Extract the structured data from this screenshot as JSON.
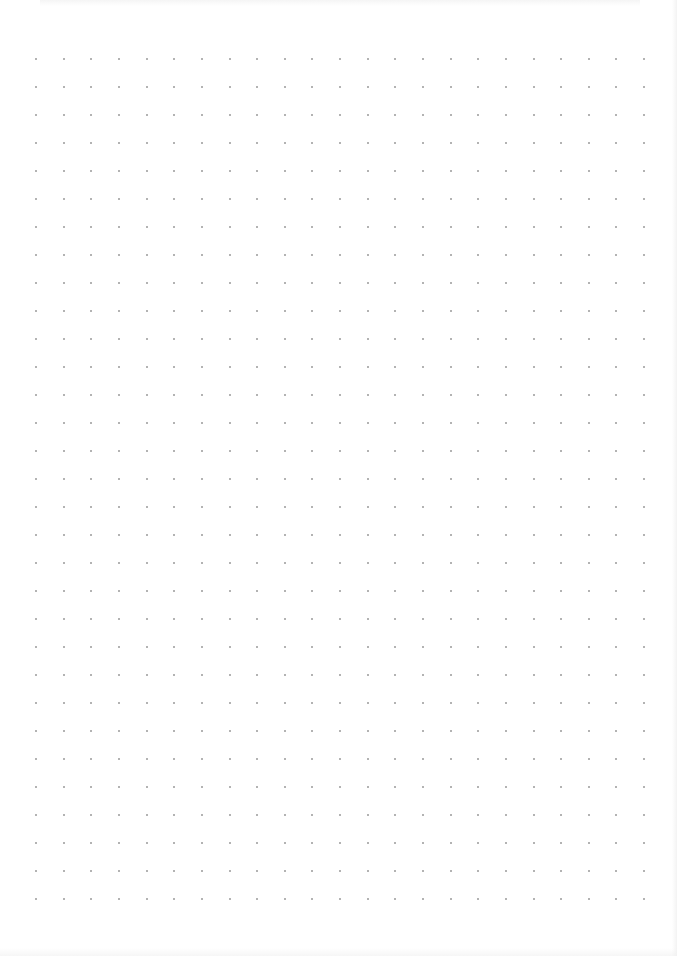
{
  "document": {
    "type": "dot-grid-paper",
    "width": 677,
    "height": 956
  },
  "grid": {
    "origin_x": 36,
    "origin_y": 59,
    "spacing_x": 27.64,
    "spacing_y": 28.0,
    "columns": 23,
    "rows": 31,
    "dot_size": 2,
    "dot_color": "#9a9a9a"
  },
  "colors": {
    "paper": "#ffffff",
    "dot": "#9a9a9a"
  }
}
